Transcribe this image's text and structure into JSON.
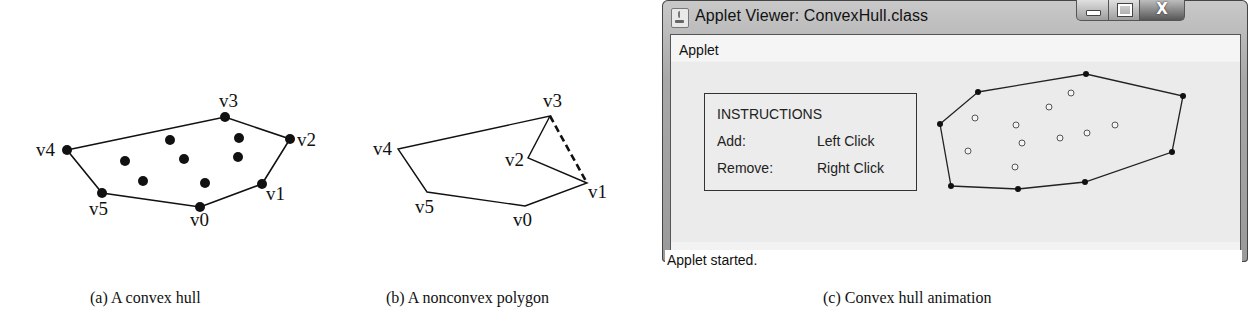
{
  "figures": {
    "a": {
      "caption": "(a) A convex hull",
      "hull_vertices": [
        {
          "label": "v0",
          "x": 200,
          "y": 207,
          "lx": 190,
          "ly": 226
        },
        {
          "label": "v1",
          "x": 262,
          "y": 184,
          "lx": 266,
          "ly": 200
        },
        {
          "label": "v2",
          "x": 290,
          "y": 139,
          "lx": 297,
          "ly": 146
        },
        {
          "label": "v3",
          "x": 225,
          "y": 117,
          "lx": 219,
          "ly": 107
        },
        {
          "label": "v4",
          "x": 67,
          "y": 150,
          "lx": 36,
          "ly": 156
        },
        {
          "label": "v5",
          "x": 102,
          "y": 193,
          "lx": 89,
          "ly": 215
        }
      ],
      "interior_points": [
        {
          "x": 170,
          "y": 140
        },
        {
          "x": 239,
          "y": 138
        },
        {
          "x": 125,
          "y": 161
        },
        {
          "x": 184,
          "y": 159
        },
        {
          "x": 238,
          "y": 157
        },
        {
          "x": 143,
          "y": 181
        },
        {
          "x": 205,
          "y": 183
        }
      ]
    },
    "b": {
      "caption": "(b) A nonconvex polygon",
      "vertices": [
        {
          "label": "v0",
          "x": 525,
          "y": 206,
          "lx": 513,
          "ly": 226
        },
        {
          "label": "v1",
          "x": 587,
          "y": 183,
          "lx": 588,
          "ly": 198
        },
        {
          "label": "v2",
          "x": 528,
          "y": 158,
          "lx": 505,
          "ly": 166
        },
        {
          "label": "v3",
          "x": 550,
          "y": 116,
          "lx": 543,
          "ly": 107
        },
        {
          "label": "v4",
          "x": 398,
          "y": 149,
          "lx": 373,
          "ly": 155
        },
        {
          "label": "v5",
          "x": 427,
          "y": 192,
          "lx": 415,
          "ly": 213
        }
      ],
      "dashed_edge": [
        "v3",
        "v1"
      ]
    },
    "c": {
      "caption": "(c) Convex hull animation"
    }
  },
  "window": {
    "title": "Applet Viewer: ConvexHull.class",
    "controls": {
      "minimize": "minimize",
      "maximize": "maximize",
      "close": "X"
    },
    "menu": [
      "Applet"
    ],
    "instructions": {
      "heading": "INSTRUCTIONS",
      "rows": [
        {
          "action": "Add:",
          "input": "Left Click"
        },
        {
          "action": "Remove:",
          "input": "Right Click"
        }
      ]
    },
    "status": "Applet started.",
    "hull_points": [
      {
        "x": 978,
        "y": 92
      },
      {
        "x": 1086,
        "y": 74
      },
      {
        "x": 1183,
        "y": 96
      },
      {
        "x": 1172,
        "y": 152
      },
      {
        "x": 1085,
        "y": 182
      },
      {
        "x": 1018,
        "y": 189
      },
      {
        "x": 951,
        "y": 186
      },
      {
        "x": 940,
        "y": 124
      }
    ],
    "interior_points": [
      {
        "x": 1071,
        "y": 93
      },
      {
        "x": 1049,
        "y": 107
      },
      {
        "x": 975,
        "y": 118
      },
      {
        "x": 1016,
        "y": 125
      },
      {
        "x": 1115,
        "y": 125
      },
      {
        "x": 1087,
        "y": 133
      },
      {
        "x": 1060,
        "y": 138
      },
      {
        "x": 1022,
        "y": 143
      },
      {
        "x": 968,
        "y": 151
      },
      {
        "x": 1015,
        "y": 167
      }
    ]
  },
  "colors": {
    "ink": "#111111",
    "panel": "#ebebeb",
    "frame": "#a8a8a8"
  }
}
